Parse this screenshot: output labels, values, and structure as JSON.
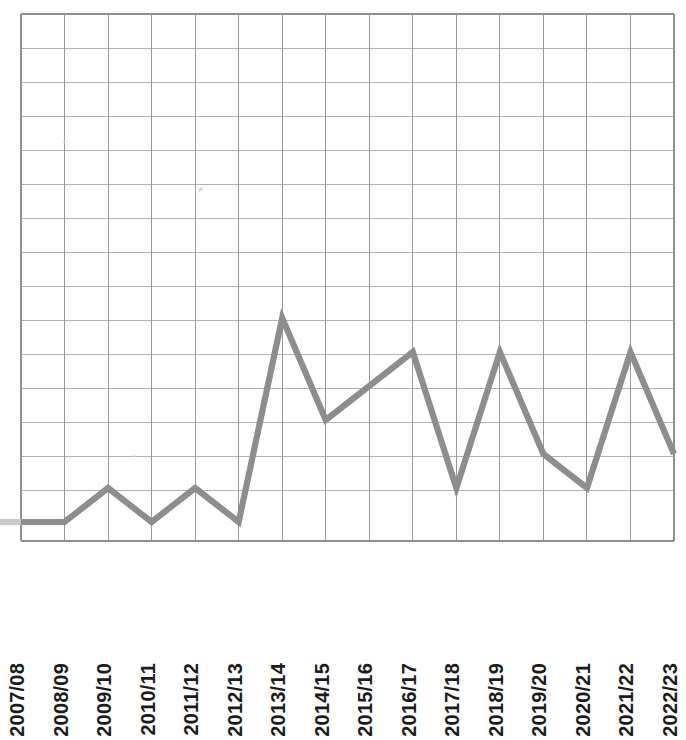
{
  "chart_data": {
    "type": "line",
    "title": "",
    "subtitle": "",
    "xlabel": "",
    "ylabel": "",
    "legend": [],
    "legend_position": "none",
    "grid": true,
    "categories": [
      "2007/08",
      "2008/09",
      "2009/10",
      "2010/11",
      "2011/12",
      "2012/13",
      "2013/14",
      "2014/15",
      "2015/16",
      "2016/17",
      "2017/18",
      "2018/19",
      "2019/20",
      "2020/21",
      "2021/22",
      "2022/23"
    ],
    "values": [
      0,
      0,
      1,
      0,
      1,
      0,
      6,
      3,
      4,
      5,
      1,
      5,
      2,
      1,
      5,
      2
    ],
    "ylim": [
      0,
      15.5
    ],
    "yticks": [
      0,
      1,
      2,
      3,
      4,
      5,
      6,
      7,
      8,
      9,
      10,
      11,
      12,
      13,
      14,
      15
    ],
    "ytick_labels": [],
    "series_color": "#8d8d8d",
    "grid_color": "#b0b0b0",
    "background_color": "#ffffff",
    "annotations": []
  },
  "axis": {
    "x_tick_labels": [
      "2007/08",
      "2008/09",
      "2009/10",
      "2010/11",
      "2011/12",
      "2012/13",
      "2013/14",
      "2014/15",
      "2015/16",
      "2016/17",
      "2017/18",
      "2018/19",
      "2019/20",
      "2020/21",
      "2021/22",
      "2022/23"
    ]
  },
  "geometry": {
    "plot_left": 21,
    "plot_right": 674,
    "plot_top": 14,
    "plot_bottom": 541,
    "baseline_y": 522,
    "row_height": 34,
    "column_width": 43.53
  }
}
